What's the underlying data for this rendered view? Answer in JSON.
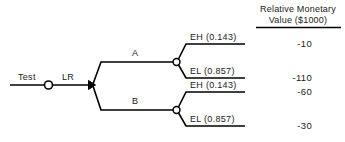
{
  "diagram": {
    "type": "decision-tree",
    "title_lines": [
      "Relative Monetary",
      "Value ($1000)"
    ],
    "root": {
      "label": "Test",
      "chance_node": "open-circle",
      "second_label": "LR",
      "decision_node": "filled-triangle"
    },
    "branches": [
      {
        "label": "A",
        "outcomes": [
          {
            "label": "EH (0.143)",
            "value": "-10"
          },
          {
            "label": "EL (0.857)",
            "value": "-110"
          }
        ]
      },
      {
        "label": "B",
        "outcomes": [
          {
            "label": "EH (0.143)",
            "value": "-60"
          },
          {
            "label": "EL (0.857)",
            "value": "-30"
          }
        ]
      }
    ],
    "colors": {
      "line": "#000000",
      "text": "#1a1a1a",
      "background": "#ffffff"
    }
  }
}
